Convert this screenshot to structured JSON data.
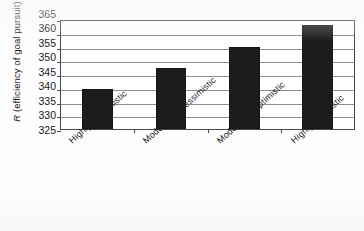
{
  "chart_data": {
    "type": "bar",
    "title": "",
    "subtitle": "",
    "xlabel": "",
    "ylabel": "R (efficiency of goal pursuit)",
    "ylabel_symbol": "R",
    "ylabel_rest": " (efficiency of goal pursuit)",
    "categories": [
      "Highly pessimistic",
      "Moderately pessimistic",
      "Moderately optimistic",
      "Highly optimistic"
    ],
    "values": [
      340,
      347.5,
      355.5,
      363.5
    ],
    "ylim": [
      325,
      365
    ],
    "ytick_step": 5,
    "yticks": [
      365,
      360,
      355,
      350,
      345,
      340,
      335,
      330,
      325
    ],
    "ytick_labels": [
      "365",
      "360",
      "355",
      "350",
      "345",
      "340",
      "335",
      "330",
      "325"
    ],
    "grid": true,
    "grid_axis": "y",
    "legend": null,
    "legend_position": "none",
    "bar_color": "#1c1c1c",
    "grid_color": "#8d8d8d",
    "axis_color": "#4a4a4a",
    "background_color": "#ffffff",
    "xtick_label_rotation": -42
  },
  "caption": {
    "remnant_text": ""
  }
}
